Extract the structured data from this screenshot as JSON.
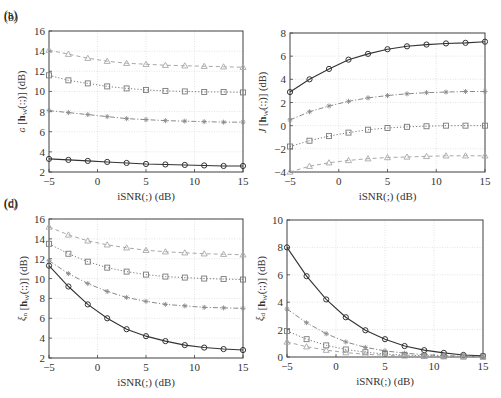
{
  "figure": {
    "width": 501,
    "height": 398
  },
  "chart_data": [
    {
      "type": "line",
      "panel_label": "(a)",
      "title": "",
      "xlabel": "iSNR(;) (dB)",
      "ylabel": "G [h_W(:;)] (dB)",
      "ylabel_symbol": "ɢ",
      "x": [
        -5,
        -3,
        -1,
        1,
        3,
        5,
        7,
        9,
        11,
        13,
        15
      ],
      "xlim": [
        -5,
        15
      ],
      "ylim": [
        2,
        16
      ],
      "xticks": [
        -5,
        0,
        5,
        10,
        15
      ],
      "yticks": [
        2,
        4,
        6,
        8,
        10,
        12,
        14,
        16
      ],
      "grid": true,
      "box": {
        "left": 49,
        "top": 31,
        "right": 243,
        "bottom": 172
      },
      "series": [
        {
          "name": "circle-solid",
          "marker": "circle",
          "line": "solid",
          "color": "#333333",
          "values": [
            3.3,
            3.2,
            3.1,
            3.0,
            2.9,
            2.8,
            2.75,
            2.7,
            2.65,
            2.6,
            2.6
          ]
        },
        {
          "name": "star-dashdot",
          "marker": "star",
          "line": "dashdot",
          "color": "#8a8a8a",
          "values": [
            8.1,
            7.9,
            7.7,
            7.5,
            7.3,
            7.2,
            7.1,
            7.05,
            7.0,
            6.95,
            6.95
          ]
        },
        {
          "name": "square-dotted",
          "marker": "square",
          "line": "dotted",
          "color": "#7a7a7a",
          "values": [
            11.6,
            11.1,
            10.8,
            10.5,
            10.3,
            10.15,
            10.05,
            10.0,
            9.95,
            9.95,
            9.9
          ]
        },
        {
          "name": "triangle-dashed",
          "marker": "triangle",
          "line": "dashed",
          "color": "#a8a8a8",
          "values": [
            14.1,
            13.7,
            13.3,
            13.0,
            12.8,
            12.7,
            12.6,
            12.55,
            12.5,
            12.45,
            12.4
          ]
        }
      ]
    },
    {
      "type": "line",
      "panel_label": "(b)",
      "title": "",
      "xlabel": "iSNR(;) (dB)",
      "ylabel": "J [h_W(:;)] (dB)",
      "ylabel_symbol": "J",
      "x": [
        -5,
        -3,
        -1,
        1,
        3,
        5,
        7,
        9,
        11,
        13,
        15
      ],
      "xlim": [
        -5,
        15
      ],
      "ylim": [
        -4,
        8
      ],
      "xticks": [
        -5,
        0,
        5,
        10,
        15
      ],
      "yticks": [
        -4,
        -2,
        0,
        2,
        4,
        6,
        8
      ],
      "grid": true,
      "box": {
        "left": 290,
        "top": 33,
        "right": 485,
        "bottom": 172
      },
      "series": [
        {
          "name": "circle-solid",
          "marker": "circle",
          "line": "solid",
          "color": "#333333",
          "values": [
            2.9,
            4.0,
            4.9,
            5.7,
            6.2,
            6.6,
            6.85,
            7.0,
            7.1,
            7.15,
            7.25
          ]
        },
        {
          "name": "star-dashdot",
          "marker": "star",
          "line": "dashdot",
          "color": "#8a8a8a",
          "values": [
            0.5,
            1.2,
            1.7,
            2.1,
            2.4,
            2.6,
            2.75,
            2.85,
            2.9,
            2.95,
            2.95
          ]
        },
        {
          "name": "square-dotted",
          "marker": "square",
          "line": "dotted",
          "color": "#7a7a7a",
          "values": [
            -1.8,
            -1.3,
            -0.9,
            -0.6,
            -0.35,
            -0.2,
            -0.1,
            -0.05,
            0.0,
            0.0,
            0.0
          ]
        },
        {
          "name": "triangle-dashed",
          "marker": "triangle",
          "line": "dashed",
          "color": "#a8a8a8",
          "values": [
            -4.0,
            -3.5,
            -3.2,
            -3.0,
            -2.85,
            -2.75,
            -2.7,
            -2.65,
            -2.6,
            -2.6,
            -2.6
          ]
        }
      ]
    },
    {
      "type": "line",
      "panel_label": "(c)",
      "title": "",
      "xlabel": "iSNR(;) (dB)",
      "ylabel": "ξ_n [h_W(:;)] (dB)",
      "ylabel_symbol": "ξ",
      "ylabel_sub": "n",
      "x": [
        -5,
        -3,
        -1,
        1,
        3,
        5,
        7,
        9,
        11,
        13,
        15
      ],
      "xlim": [
        -5,
        15
      ],
      "ylim": [
        2,
        16
      ],
      "xticks": [
        -5,
        0,
        5,
        10,
        15
      ],
      "yticks": [
        2,
        4,
        6,
        8,
        10,
        12,
        14,
        16
      ],
      "grid": true,
      "box": {
        "left": 49,
        "top": 219,
        "right": 243,
        "bottom": 358
      },
      "series": [
        {
          "name": "circle-solid",
          "marker": "circle",
          "line": "solid",
          "color": "#333333",
          "values": [
            11.3,
            9.2,
            7.4,
            6.0,
            4.9,
            4.2,
            3.7,
            3.3,
            3.05,
            2.9,
            2.8
          ]
        },
        {
          "name": "star-dashdot",
          "marker": "star",
          "line": "dashdot",
          "color": "#8a8a8a",
          "values": [
            11.8,
            10.5,
            9.5,
            8.7,
            8.1,
            7.7,
            7.4,
            7.25,
            7.1,
            7.05,
            7.0
          ]
        },
        {
          "name": "square-dotted",
          "marker": "square",
          "line": "dotted",
          "color": "#7a7a7a",
          "values": [
            13.5,
            12.5,
            11.7,
            11.1,
            10.7,
            10.4,
            10.2,
            10.1,
            10.0,
            9.95,
            9.9
          ]
        },
        {
          "name": "triangle-dashed",
          "marker": "triangle",
          "line": "dashed",
          "color": "#a8a8a8",
          "values": [
            15.2,
            14.4,
            13.8,
            13.4,
            13.1,
            12.85,
            12.7,
            12.6,
            12.5,
            12.45,
            12.4
          ]
        }
      ]
    },
    {
      "type": "line",
      "panel_label": "(d)",
      "title": "",
      "xlabel": "iSNR(;) (dB)",
      "ylabel": "ξ_d [h_W(:;)] (dB)",
      "ylabel_symbol": "ξ",
      "ylabel_sub": "d",
      "x": [
        -5,
        -3,
        -1,
        1,
        3,
        5,
        7,
        9,
        11,
        13,
        15
      ],
      "xlim": [
        -5,
        15
      ],
      "ylim": [
        0,
        10
      ],
      "xticks": [
        -5,
        0,
        5,
        10,
        15
      ],
      "yticks": [
        0,
        2,
        4,
        6,
        8,
        10
      ],
      "grid": true,
      "box": {
        "left": 287,
        "top": 220,
        "right": 483,
        "bottom": 357
      },
      "series": [
        {
          "name": "circle-solid",
          "marker": "circle",
          "line": "solid",
          "color": "#333333",
          "values": [
            8.0,
            5.9,
            4.2,
            2.9,
            1.95,
            1.3,
            0.8,
            0.5,
            0.3,
            0.15,
            0.08
          ]
        },
        {
          "name": "star-dashdot",
          "marker": "star",
          "line": "dashdot",
          "color": "#8a8a8a",
          "values": [
            3.5,
            2.5,
            1.7,
            1.1,
            0.7,
            0.45,
            0.28,
            0.17,
            0.1,
            0.06,
            0.04
          ]
        },
        {
          "name": "square-dotted",
          "marker": "square",
          "line": "dotted",
          "color": "#7a7a7a",
          "values": [
            1.9,
            1.3,
            0.85,
            0.55,
            0.35,
            0.22,
            0.14,
            0.09,
            0.06,
            0.04,
            0.03
          ]
        },
        {
          "name": "triangle-dashed",
          "marker": "triangle",
          "line": "dashed",
          "color": "#a8a8a8",
          "values": [
            1.1,
            0.75,
            0.5,
            0.32,
            0.2,
            0.13,
            0.08,
            0.05,
            0.03,
            0.02,
            0.01
          ]
        }
      ]
    }
  ]
}
